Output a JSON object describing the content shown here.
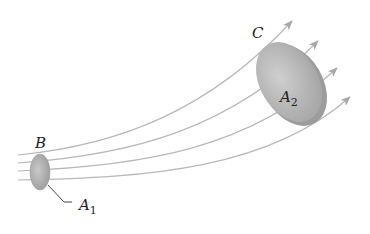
{
  "diagram": {
    "type": "flow tube with streamlines",
    "labels": {
      "section_start": "B",
      "section_end": "C",
      "area_start": "A",
      "area_start_sub": "1",
      "area_end": "A",
      "area_end_sub": "2"
    },
    "streamline_count": 4,
    "colors": {
      "streamline": "#b5b5b5",
      "arrow": "#a8a8a8",
      "disk_fill": "#bdbdbd",
      "disk_edge": "#9a9a9a",
      "text": "#222222"
    }
  }
}
